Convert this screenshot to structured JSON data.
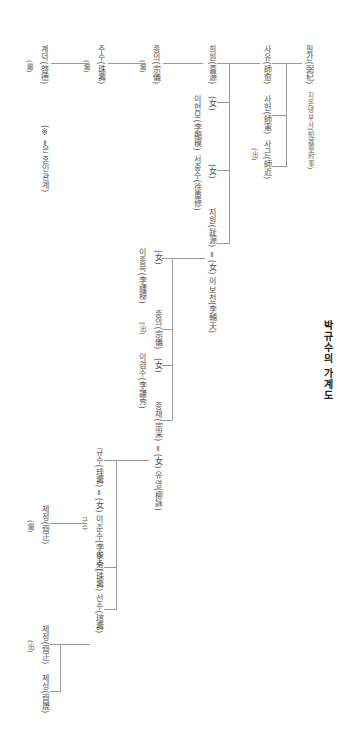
{
  "title": "박규수의 가계도",
  "note": "(※ ═은 혼인관계)",
  "gen1": {
    "name": "필간(弼杞)",
    "office": "지돈녕부사(知敦寧府事)"
  },
  "gen2": {
    "children": [
      {
        "name": "사유(師愈)"
      },
      {
        "name": "사헌(師憲)"
      },
      {
        "name": "사근(師近)",
        "mark": "(出)"
      }
    ]
  },
  "gen3": {
    "children": [
      {
        "name": "희원(喜源)"
      },
      {
        "name": "(女)",
        "spouse": "이현모(李顯模)"
      },
      {
        "name": "(女)",
        "spouse": "서중수(徐重修)"
      },
      {
        "name": "지원(趾源)",
        "marriage": "═ (女) 이보천(李輔天)"
      }
    ]
  },
  "gen4": {
    "children": [
      {
        "name": "(女)",
        "spouse": "이종목(李鍾穆)"
      },
      {
        "name": "종의(宗儀)",
        "mark": "(出)"
      },
      {
        "name": "(女)",
        "spouse": "이겸수(李謙秀)"
      },
      {
        "name": "종채(宗采)",
        "marriage": "═ (女) 유영(柳詠)"
      }
    ]
  },
  "adoptive_line": [
    {
      "name": "종의(宗儀)",
      "mark": "(繼)"
    },
    {
      "name": "주수(珠壽)",
      "mark": "(繼)"
    },
    {
      "name": "계덕(啓德)",
      "mark": "(繼)"
    }
  ],
  "gen5": {
    "children": [
      {
        "name": "규수(珪壽)",
        "marriage": "═ (女) 이준수(李俊秀)",
        "note": "군수"
      },
      {
        "name": "주수(珠壽)"
      },
      {
        "name": "선수(瑄壽)"
      }
    ]
  },
  "gen6_gyusu": {
    "name": "제정(齊正)",
    "mark": "(繼)"
  },
  "gen6_seonsu": {
    "children": [
      {
        "name": "제정(齊正)",
        "mark": "(出)"
      },
      {
        "name": "제성(齊晟)"
      }
    ]
  }
}
